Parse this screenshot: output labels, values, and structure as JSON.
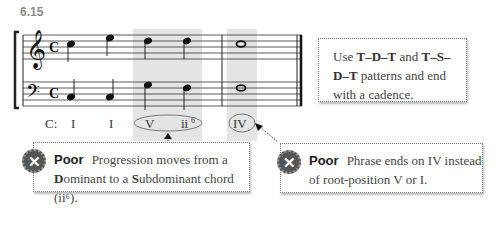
{
  "figure": {
    "number": "6.15"
  },
  "score": {
    "key_label": "C:",
    "roman_numerals": [
      "I",
      "I",
      "V",
      "ii6",
      "IV"
    ],
    "time_signature": "C",
    "circled": [
      "V ii6",
      "IV"
    ]
  },
  "tip_box": {
    "prefix": "Use ",
    "bold1": "T–D–T",
    "mid": " and ",
    "bold2": "T–S–D–T",
    "suffix": " patterns and end with a cadence."
  },
  "callouts": [
    {
      "label": "Poor",
      "text_a": "Progression moves from a",
      "bold_d": "D",
      "text_b": "ominant to a ",
      "bold_s": "S",
      "text_c": "ubdominant chord (ii⁶).",
      "icon": "x-circle-icon"
    },
    {
      "label": "Poor",
      "text": "Phrase ends on IV instead of root-position V or I.",
      "icon": "x-circle-icon"
    }
  ]
}
